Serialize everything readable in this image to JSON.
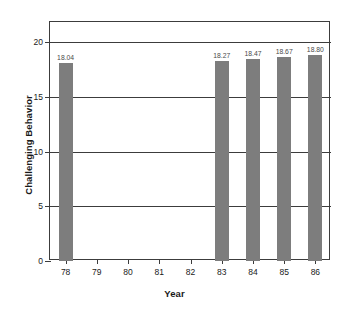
{
  "chart_data": {
    "type": "bar",
    "title": "",
    "xlabel": "Year",
    "ylabel": "Challenging Behavior",
    "categories": [
      "78",
      "79",
      "80",
      "81",
      "82",
      "83",
      "84",
      "85",
      "86"
    ],
    "values": [
      18.04,
      null,
      null,
      null,
      null,
      18.27,
      18.47,
      18.67,
      18.8
    ],
    "point_labels": [
      "18.04",
      "",
      "",
      "",
      "",
      "18.27",
      "18.47",
      "18.67",
      "18.80"
    ],
    "ylim": [
      0,
      20
    ],
    "yticks": [
      0,
      5,
      10,
      15,
      20
    ],
    "ytick_labels": [
      "0",
      "5",
      "10",
      "15",
      "20"
    ],
    "grid": true,
    "legend": "none",
    "bar_color": "#7d7d7d",
    "axis_color": "#3c3c3c",
    "label_color": "#4a4a4a"
  }
}
